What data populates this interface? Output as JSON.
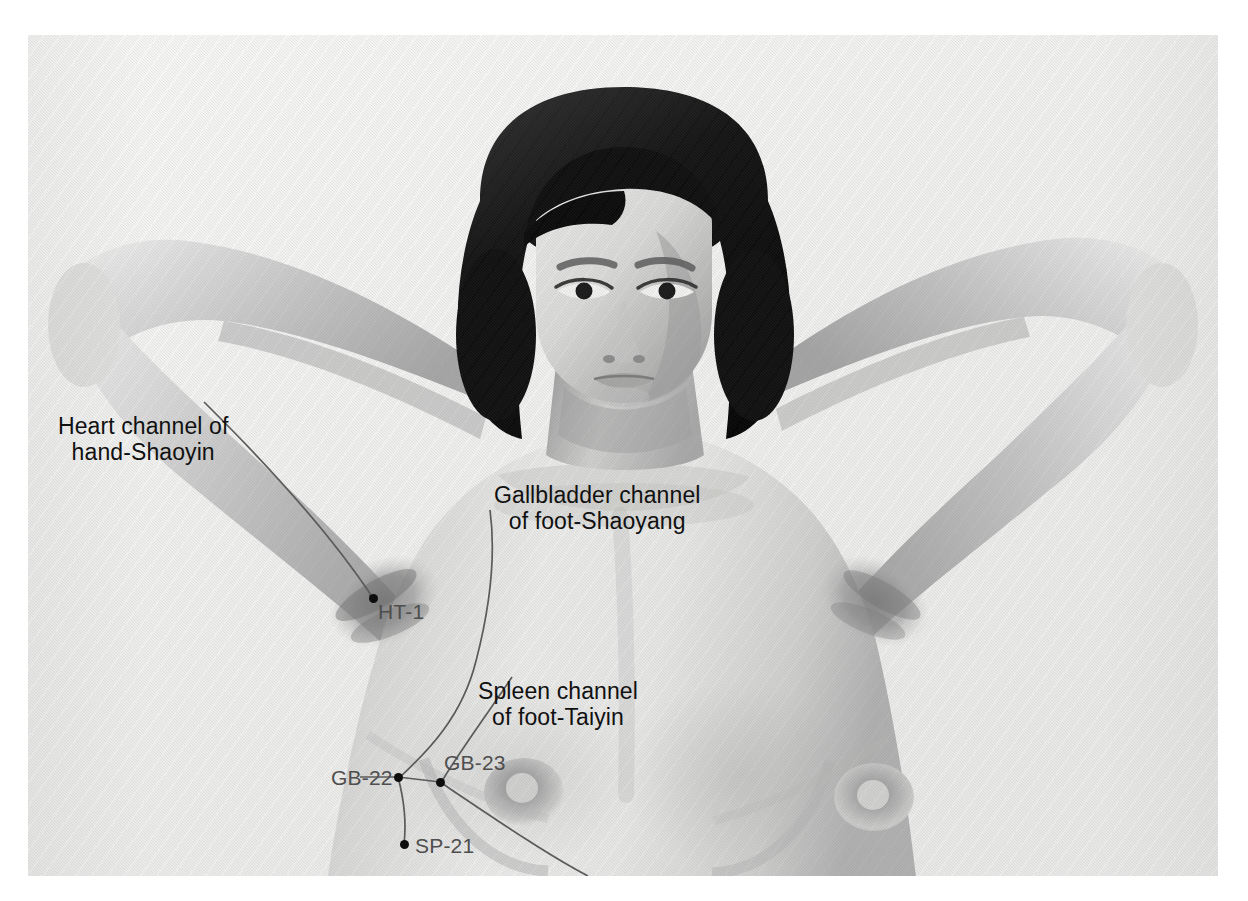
{
  "figure": {
    "kind": "anatomical-photograph",
    "color_mode": "grayscale-halftone",
    "page_background": "#ffffff",
    "plate_background": "#f2f2f1",
    "ink_color": "#111111",
    "point_label_color": "#4e4e4e",
    "point_dot_color": "#0d0d0d",
    "channel_line_color": "#5a5a5a"
  },
  "channel_labels": [
    {
      "id": "heart-channel",
      "line1": "Heart channel of",
      "line2": "hand-Shaoyin",
      "x": 58,
      "y": 413
    },
    {
      "id": "gallbladder-channel",
      "line1": "Gallbladder channel",
      "line2": "of foot-Shaoyang",
      "x": 494,
      "y": 482
    },
    {
      "id": "spleen-channel",
      "line1": "Spleen channel",
      "line2": "of foot-Taiyin",
      "x": 478,
      "y": 678
    }
  ],
  "acupoints": [
    {
      "id": "HT-1",
      "label": "HT-1",
      "dot_x": 373,
      "dot_y": 598,
      "label_x": 378,
      "label_y": 601
    },
    {
      "id": "GB-22",
      "label": "GB-22",
      "dot_x": 398,
      "dot_y": 777,
      "label_x": 331,
      "label_y": 767
    },
    {
      "id": "GB-23",
      "label": "GB-23",
      "dot_x": 440,
      "dot_y": 782,
      "label_x": 444,
      "label_y": 752
    },
    {
      "id": "SP-21",
      "label": "SP-21",
      "dot_x": 404,
      "dot_y": 844,
      "label_x": 415,
      "label_y": 835
    }
  ]
}
